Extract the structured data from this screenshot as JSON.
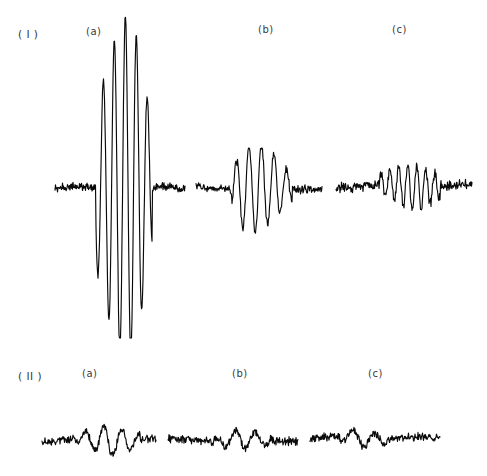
{
  "figure": {
    "background_color": "#ffffff",
    "trace_color": "#0a0a0a",
    "label_color": "#3a3a3a",
    "width": 487,
    "height": 476
  },
  "rows": [
    {
      "id": "row-1",
      "row_label": "( I )",
      "row_label_x": 18,
      "row_label_y": 28,
      "panels": [
        {
          "id": "I-a",
          "label": "(a)",
          "label_x": 86,
          "label_y": 26
        },
        {
          "id": "I-b",
          "label": "(b)",
          "label_x": 258,
          "label_y": 24
        },
        {
          "id": "I-c",
          "label": "(c)",
          "label_x": 392,
          "label_y": 24
        }
      ]
    },
    {
      "id": "row-2",
      "row_label": "( II )",
      "row_label_x": 18,
      "row_label_y": 370,
      "panels": [
        {
          "id": "II-a",
          "label": "(a)",
          "label_x": 82,
          "label_y": 368
        },
        {
          "id": "II-b",
          "label": "(b)",
          "label_x": 232,
          "label_y": 368
        },
        {
          "id": "II-c",
          "label": "(c)",
          "label_x": 368,
          "label_y": 368
        }
      ]
    }
  ],
  "chart_data": {
    "type": "line",
    "title": "",
    "xlabel": "",
    "ylabel": "",
    "grid": false,
    "legend": "none",
    "series": [
      {
        "name": "I-a",
        "row": 1,
        "panel": "a",
        "x_start": 55,
        "x_end": 185,
        "baseline_y": 188,
        "noise_amplitude": 5,
        "noise_seed": 11,
        "packet_start": 96,
        "packet_end": 152,
        "envelope_peak_x": 128,
        "envelope_rise": 26,
        "envelope_fall": 17,
        "peak_amplitude": 172,
        "period": 11.0,
        "phase": 3.1,
        "ymin": 16,
        "ymax": 338
      },
      {
        "name": "I-b",
        "row": 1,
        "panel": "b",
        "x_start": 196,
        "x_end": 322,
        "baseline_y": 188,
        "noise_amplitude": 5,
        "noise_seed": 27,
        "packet_start": 232,
        "packet_end": 292,
        "envelope_peak_x": 252,
        "envelope_rise": 16,
        "envelope_fall": 26,
        "peak_amplitude": 46,
        "period": 12.5,
        "phase": 3.1,
        "ymin": 148,
        "ymax": 242
      },
      {
        "name": "I-c",
        "row": 1,
        "panel": "c",
        "x_start": 336,
        "x_end": 472,
        "baseline_y": 186,
        "noise_amplitude": 6,
        "noise_seed": 43,
        "packet_start": 380,
        "packet_end": 440,
        "envelope_peak_x": 410,
        "envelope_rise": 22,
        "envelope_fall": 26,
        "peak_amplitude": 22,
        "period": 9.0,
        "phase": 3.1,
        "ymin": 158,
        "ymax": 224
      },
      {
        "name": "II-a",
        "row": 2,
        "panel": "a",
        "x_start": 42,
        "x_end": 156,
        "baseline_y": 440,
        "noise_amplitude": 5,
        "noise_seed": 61,
        "packet_start": 78,
        "packet_end": 140,
        "envelope_peak_x": 108,
        "envelope_rise": 20,
        "envelope_fall": 22,
        "peak_amplitude": 14,
        "period": 18.0,
        "phase": 3.1,
        "ymin": 414,
        "ymax": 462
      },
      {
        "name": "II-b",
        "row": 2,
        "panel": "b",
        "x_start": 168,
        "x_end": 298,
        "baseline_y": 440,
        "noise_amplitude": 5,
        "noise_seed": 79,
        "packet_start": 214,
        "packet_end": 272,
        "envelope_peak_x": 240,
        "envelope_rise": 18,
        "envelope_fall": 22,
        "peak_amplitude": 9,
        "period": 20.0,
        "phase": 3.1,
        "ymin": 420,
        "ymax": 456
      },
      {
        "name": "II-c",
        "row": 2,
        "panel": "c",
        "x_start": 310,
        "x_end": 440,
        "baseline_y": 438,
        "noise_amplitude": 5,
        "noise_seed": 97,
        "packet_start": 340,
        "packet_end": 392,
        "envelope_peak_x": 358,
        "envelope_rise": 16,
        "envelope_fall": 22,
        "peak_amplitude": 8,
        "period": 22.0,
        "phase": 3.1,
        "ymin": 420,
        "ymax": 456
      }
    ]
  }
}
